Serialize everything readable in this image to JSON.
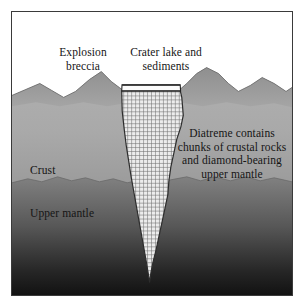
{
  "figure": {
    "frame_color": "#3a3a3a",
    "background_color": "#ffffff"
  },
  "labels": {
    "explosion_breccia": "Explosion\nbreccia",
    "crater_lake": "Crater lake and\nsediments",
    "diatreme_note": "Diatreme contains\nchunks of crustal rocks\nand diamond-bearing\nupper mantle",
    "crust": "Crust",
    "upper_mantle": "Upper mantle"
  },
  "colors": {
    "sky": "#ffffff",
    "ridge_dark": "#8b8b8b",
    "crust": "#a9a9a9",
    "crust_lower": "#9e9e9e",
    "mantle_top": "#7b7b7b",
    "mantle_bottom": "#141414",
    "diatreme_fill": "#e6e6e6",
    "diatreme_hatch": "#707070",
    "diatreme_outline": "#2a2a2a",
    "lake_fill": "#fbfbfb",
    "text": "#151515"
  },
  "geometry": {
    "note": "All coordinates are in the 282x285 inner-frame coordinate space.",
    "surface_ridge_profile": "M0,84 L14,78 L28,72 L40,79 L52,86 L64,80 L78,68 L90,60 L100,70 L108,76 L112,79 L168,79 L176,72 L186,62 L196,56 L208,62 L218,72 L228,80 L240,74 L252,66 L264,72 L276,80 L282,76 L282,100 L0,100 Z",
    "surface_top_line": "M0,84 L14,78 L28,72 L40,79 L52,86 L64,80 L78,68 L90,60 L100,70 L108,76 L112,79 L168,79 L176,72 L186,62 L196,56 L208,62 L218,72 L228,80 L240,74 L252,66 L264,72 L276,80 L282,76",
    "crust_mantle_boundary": "M0,172 L16,168 L30,171 L46,166 L60,170 L74,167 L88,171 L102,168 L116,172 L130,169 L146,173 L160,169 L176,166 L190,170 L204,166 L220,170 L236,166 L250,170 L264,167 L282,171",
    "diatreme_outline": "M112,79 L168,79 L170,84 L172,112 L166,128 L162,150 L158,170 L156,196 L152,214 L148,236 L144,252 L140,266 L136,252 L132,232 L128,208 L124,188 L120,166 L116,142 L112,118 L110,96 Z",
    "crater_lake_band": "M112,74 L168,74 L168,79 L112,79 Z",
    "hatch_spacing_px": 4
  }
}
